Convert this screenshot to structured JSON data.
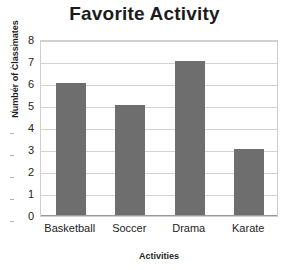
{
  "chart_data": {
    "type": "bar",
    "title": "Favorite Activity",
    "xlabel": "Activities",
    "ylabel": "Number of Classmates",
    "categories": [
      "Basketball",
      "Soccer",
      "Drama",
      "Karate"
    ],
    "values": [
      6,
      5,
      7,
      3
    ],
    "ylim": [
      0,
      8
    ],
    "ytick_step": 1,
    "yticks": [
      "8",
      "7",
      "6",
      "5",
      "4",
      "3",
      "2",
      "1",
      "0"
    ],
    "grid": "horizontal",
    "legend": "none",
    "colors": {
      "bar_fill": "#6e6e6e",
      "gridline": "#d2d2d2",
      "plot_border": "#cfcfcf",
      "axis_line": "#9a9a9a",
      "title_text": "#1c1c1c",
      "label_text": "#232323",
      "background": "#ffffff"
    }
  }
}
